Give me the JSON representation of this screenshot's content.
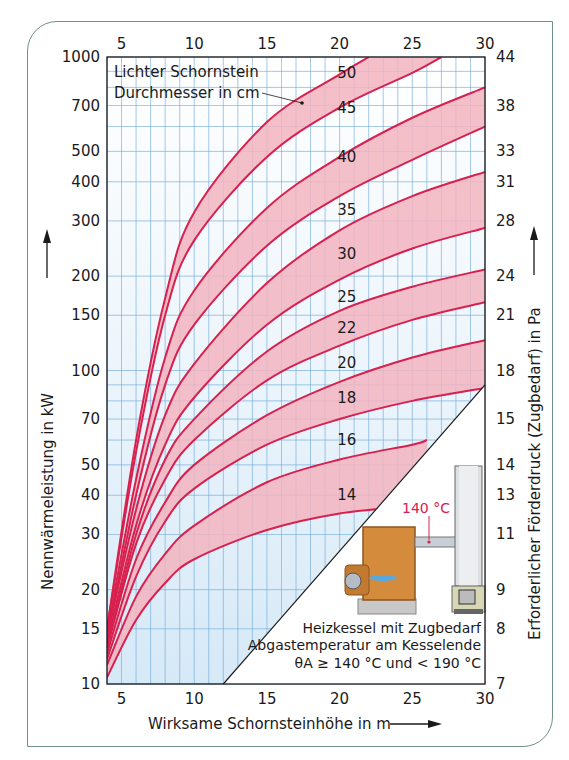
{
  "chart_data": {
    "type": "line",
    "title": "",
    "xlabel": "Wirksame Schornsteinhöhe in m",
    "ylabel": "Nennwärmeleistung in kW",
    "y2label": "Erforderlicher Förderdruck (Zugbedarf) in Pa",
    "xlim": [
      4,
      30
    ],
    "ylim": [
      10,
      1000
    ],
    "yscale": "log",
    "grid": true,
    "x_ticks": [
      5,
      10,
      15,
      20,
      25,
      30
    ],
    "y_ticks": [
      10,
      15,
      20,
      30,
      40,
      50,
      70,
      100,
      150,
      200,
      300,
      400,
      500,
      700,
      1000
    ],
    "y2_ticks": [
      {
        "at": 10,
        "label": "7"
      },
      {
        "at": 15,
        "label": "8"
      },
      {
        "at": 20,
        "label": "9"
      },
      {
        "at": 30,
        "label": "11"
      },
      {
        "at": 40,
        "label": "13"
      },
      {
        "at": 50,
        "label": "14"
      },
      {
        "at": 70,
        "label": "15"
      },
      {
        "at": 100,
        "label": "18"
      },
      {
        "at": 150,
        "label": "21"
      },
      {
        "at": 200,
        "label": "24"
      },
      {
        "at": 300,
        "label": "28"
      },
      {
        "at": 400,
        "label": "31"
      },
      {
        "at": 500,
        "label": "33"
      },
      {
        "at": 700,
        "label": "38"
      },
      {
        "at": 1000,
        "label": "44"
      }
    ],
    "legend_title": [
      "Lichter Schornstein",
      "Durchmesser in cm"
    ],
    "series": [
      {
        "name": "c1",
        "x": [
          4,
          6,
          8,
          10,
          15,
          20,
          22
        ],
        "y": [
          15,
          60,
          170,
          320,
          620,
          880,
          1000
        ]
      },
      {
        "name": "c2",
        "x": [
          4,
          6,
          8,
          10,
          15,
          20,
          25,
          27
        ],
        "y": [
          15,
          55,
          150,
          260,
          480,
          690,
          890,
          1000
        ]
      },
      {
        "name": "c3",
        "x": [
          4,
          6,
          8,
          10,
          15,
          20,
          25,
          30
        ],
        "y": [
          14.5,
          45,
          110,
          180,
          330,
          480,
          640,
          800
        ]
      },
      {
        "name": "c4",
        "x": [
          4,
          6,
          8,
          10,
          15,
          20,
          25,
          30
        ],
        "y": [
          14,
          40,
          90,
          140,
          250,
          360,
          470,
          600
        ]
      },
      {
        "name": "c5",
        "x": [
          4,
          6,
          8,
          10,
          15,
          20,
          25,
          30
        ],
        "y": [
          14,
          36,
          72,
          105,
          190,
          280,
          360,
          430
        ]
      },
      {
        "name": "c6",
        "x": [
          4,
          6,
          8,
          10,
          15,
          20,
          25,
          30
        ],
        "y": [
          13.5,
          32,
          58,
          82,
          140,
          195,
          245,
          285
        ]
      },
      {
        "name": "c7",
        "x": [
          4,
          6,
          8,
          10,
          15,
          20,
          25,
          30
        ],
        "y": [
          13,
          30,
          52,
          70,
          115,
          155,
          185,
          210
        ]
      },
      {
        "name": "c8",
        "x": [
          4,
          6,
          8,
          10,
          15,
          20,
          25,
          30
        ],
        "y": [
          13,
          28,
          45,
          60,
          93,
          120,
          145,
          165
        ]
      },
      {
        "name": "c9",
        "x": [
          4,
          6,
          8,
          10,
          15,
          20,
          25,
          30
        ],
        "y": [
          12.5,
          25,
          38,
          50,
          72,
          92,
          110,
          125
        ]
      },
      {
        "name": "c10",
        "x": [
          4,
          6,
          8,
          10,
          15,
          20,
          25,
          30
        ],
        "y": [
          12,
          22,
          33,
          42,
          58,
          70,
          80,
          88
        ]
      },
      {
        "name": "c11",
        "x": [
          4,
          6,
          8,
          10,
          15,
          20,
          25,
          26
        ],
        "y": [
          11.5,
          19,
          26,
          32,
          44,
          52,
          58,
          60
        ]
      },
      {
        "name": "c12",
        "x": [
          4,
          6,
          8,
          10,
          15,
          20,
          25,
          26
        ],
        "y": [
          10.5,
          16,
          21,
          25,
          31,
          35,
          37,
          38
        ]
      }
    ],
    "bands": [
      [
        "c1",
        "c2"
      ],
      [
        "c3",
        "c4"
      ],
      [
        "c5",
        "c6"
      ],
      [
        "c7",
        "c8"
      ],
      [
        "c9",
        "c10"
      ],
      [
        "c11",
        "c12"
      ]
    ],
    "diameter_labels": [
      {
        "label": "50",
        "x": 20.5,
        "y": 890
      },
      {
        "label": "45",
        "x": 20.5,
        "y": 690
      },
      {
        "label": "40",
        "x": 20.5,
        "y": 480
      },
      {
        "label": "35",
        "x": 20.5,
        "y": 325
      },
      {
        "label": "30",
        "x": 20.5,
        "y": 235
      },
      {
        "label": "25",
        "x": 20.5,
        "y": 172
      },
      {
        "label": "22",
        "x": 20.5,
        "y": 137
      },
      {
        "label": "20",
        "x": 20.5,
        "y": 106
      },
      {
        "label": "18",
        "x": 20.5,
        "y": 82
      },
      {
        "label": "16",
        "x": 20.5,
        "y": 60
      },
      {
        "label": "14",
        "x": 20.5,
        "y": 40
      }
    ],
    "inset": {
      "temp_label": "140 °C",
      "caption": [
        "Heizkessel mit Zugbedarf",
        "Abgastemperatur am Kesselende",
        "θA ≥ 140 °C und < 190 °C"
      ],
      "boundary": [
        [
          12,
          10
        ],
        [
          30,
          90
        ]
      ]
    },
    "colors": {
      "band": "#f2b4bf",
      "curve": "#d8204f",
      "grid": "#6aa6d8",
      "bg_low": "#d6e9f7"
    }
  }
}
